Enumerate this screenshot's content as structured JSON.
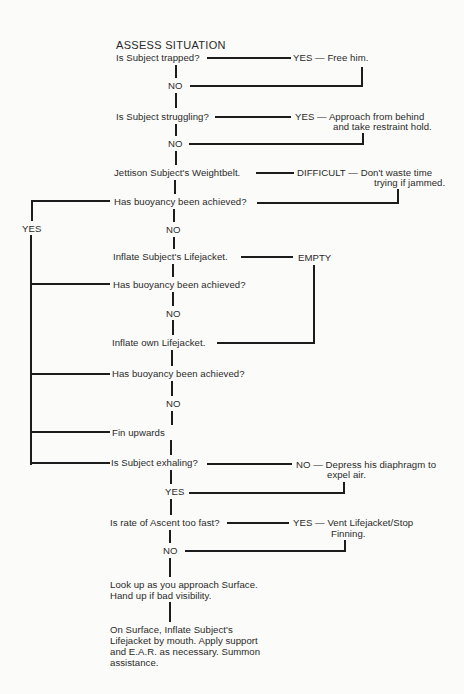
{
  "flowchart": {
    "title": "ASSESS SITUATION",
    "steps": {
      "trapped_q": "Is Subject trapped?",
      "trapped_yes": "YES — Free him.",
      "no1": "NO",
      "struggling_q": "Is Subject struggling?",
      "struggling_yes_1": "YES — Approach from behind",
      "struggling_yes_2": "and take restraint hold.",
      "no2": "NO",
      "weightbelt": "Jettison Subject's Weightbelt.",
      "difficult_1": "DIFFICULT — Don't waste time",
      "difficult_2": "trying if jammed.",
      "buoyancy_q1": "Has buoyancy been achieved?",
      "yes_left": "YES",
      "no3": "NO",
      "inflate_subject": "Inflate Subject's Lifejacket.",
      "empty": "EMPTY",
      "buoyancy_q2": "Has buoyancy been achieved?",
      "no4": "NO",
      "inflate_own": "Inflate own Lifejacket.",
      "buoyancy_q3": "Has buoyancy been achieved?",
      "no5": "NO",
      "fin_upwards": "Fin upwards",
      "exhaling_q": "Is Subject exhaling?",
      "exhaling_no_1": "NO — Depress his diaphragm to",
      "exhaling_no_2": "expel air.",
      "yes_exhaling": "YES",
      "ascent_q": "Is rate of Ascent too fast?",
      "ascent_yes_1": "YES — Vent Lifejacket/Stop",
      "ascent_yes_2": "Finning.",
      "no6": "NO",
      "look_up": "Look up as you approach Surface. Hand up if bad visibility.",
      "on_surface": "On Surface, Inflate Subject's Lifejacket by mouth. Apply support and E.A.R. as necessary. Summon assistance."
    }
  }
}
